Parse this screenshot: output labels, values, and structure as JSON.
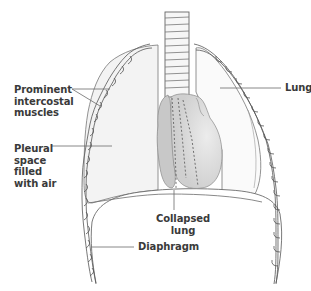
{
  "figure": {
    "type": "anatomical-illustration"
  },
  "labels": {
    "intercostal": "Prominent\nintercostal\nmuscles",
    "pleural": "Pleural\nspace\nfilled\nwith air",
    "lung": "Lung",
    "collapsed": "Collapsed\nlung",
    "diaphragm": "Diaphragm"
  },
  "colors": {
    "outline": "#6b6b6b",
    "pleural_fill": "#f3f3f3",
    "collapsed_lung_fill": "#c9c9c9",
    "heart_fill": "#d6d6d6",
    "label_text": "#3a3a3a",
    "leader_line": "#6b6b6b"
  }
}
